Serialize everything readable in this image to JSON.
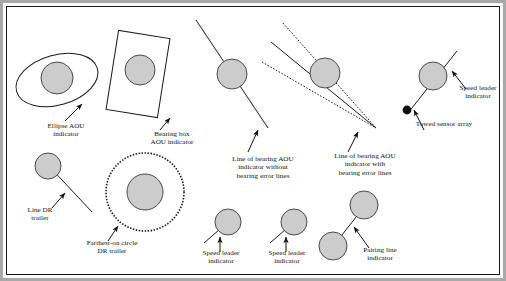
{
  "figure": {
    "kind": "symbology-reference-diagram",
    "background_color": "#ffffff",
    "frame_color": "#a8a8a8",
    "line_color": "#1a1a1a",
    "contact_fill_color": "#cccccc",
    "contact_stroke_color": "#444444"
  },
  "labels": [
    {
      "id": "ellipse-aou",
      "text": "Ellipse AOU\nindicator"
    },
    {
      "id": "bearing-box-aou",
      "text": "Bearing box\nAOU indicator"
    },
    {
      "id": "lob-without-error",
      "text": "Line of bearing AOU\nindicator without\nbearing error lines"
    },
    {
      "id": "lob-with-error",
      "text": "Line of bearing AOU\nindicator with\nbearing error lines"
    },
    {
      "id": "speed-leader-top",
      "text": "Speed leader\nindicator"
    },
    {
      "id": "towed-sensor-array",
      "text": "Towed sensor array"
    },
    {
      "id": "line-dr-trailer",
      "text": "Line DR\ntrailer"
    },
    {
      "id": "farthest-on-circle",
      "text": "Farthest-on circle\nDR trailer"
    },
    {
      "id": "speed-leader-b1",
      "text": "Speed leader\nindicator"
    },
    {
      "id": "speed-leader-b2",
      "text": "Speed leader\nindicator"
    },
    {
      "id": "pairing-line",
      "text": "Pairing line\nindicator"
    }
  ],
  "symbols": [
    {
      "id": "ellipse-aou-symbol",
      "name": "Ellipse AOU indicator",
      "shape": "rotated ellipse outline enclosing a filled contact circle"
    },
    {
      "id": "bearing-box-aou-symbol",
      "name": "Bearing box AOU indicator",
      "shape": "rotated rectangle outline enclosing a filled contact circle"
    },
    {
      "id": "lob-without-error-symbol",
      "name": "Line of bearing AOU indicator without bearing error lines",
      "shape": "single solid bearing line through a filled contact circle"
    },
    {
      "id": "lob-with-error-symbol",
      "name": "Line of bearing AOU indicator with bearing error lines",
      "shape": "solid bearing line flanked by two dotted error lines converging at the sensor vertex"
    },
    {
      "id": "towed-sensor-array-symbol",
      "name": "Towed sensor array",
      "shape": "contact circle with speed leader and a trailing line ending in a solid dot"
    },
    {
      "id": "line-dr-trailer-symbol",
      "name": "Line DR trailer",
      "shape": "contact circle with a solid dead-reckoning trailer line"
    },
    {
      "id": "farthest-on-circle-symbol",
      "name": "Farthest-on circle DR trailer",
      "shape": "dotted outer circle surrounding a filled contact circle"
    },
    {
      "id": "speed-leader-b1-symbol",
      "name": "Speed leader indicator",
      "shape": "contact circle with a short solid speed leader line"
    },
    {
      "id": "speed-leader-b2-symbol",
      "name": "Speed leader indicator",
      "shape": "contact circle with a short solid speed leader line"
    },
    {
      "id": "pairing-line-symbol",
      "name": "Pairing line indicator",
      "shape": "two filled contact circles joined by a solid pairing line"
    }
  ]
}
